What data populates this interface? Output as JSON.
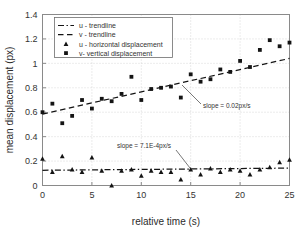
{
  "chart_data": {
    "type": "scatter",
    "title": "",
    "xlabel": "relative time (s)",
    "ylabel": "mean displacement (px)",
    "xlim": [
      0,
      25
    ],
    "ylim": [
      0,
      1.4
    ],
    "xticks": [
      "0",
      "5",
      "10",
      "15",
      "20",
      "25"
    ],
    "xtick_values": [
      0,
      5,
      10,
      15,
      20,
      25
    ],
    "yticks": [
      "0",
      "0.2",
      "0.4",
      "0.6",
      "0.8",
      "1",
      "1.2",
      "1.4"
    ],
    "ytick_values": [
      0,
      0.2,
      0.4,
      0.6,
      0.8,
      1,
      1.2,
      1.4
    ],
    "grid": true,
    "legend_position": "upper-left",
    "marker_color": "#141414",
    "line_color": "#141414",
    "grid_color": "#c8c8c8",
    "axis_color": "#8a8a8a",
    "x": [
      0,
      1,
      2,
      3,
      4,
      5,
      6,
      7,
      8,
      9,
      10,
      11,
      12,
      13,
      14,
      15,
      16,
      17,
      18,
      19,
      20,
      21,
      22,
      23,
      24,
      25
    ],
    "series": [
      {
        "name": "v- vertical displacement",
        "marker": "square",
        "values": [
          0.6,
          0.67,
          0.51,
          0.57,
          0.7,
          0.63,
          0.71,
          0.69,
          0.75,
          0.89,
          0.7,
          0.79,
          0.8,
          0.81,
          0.72,
          0.91,
          0.85,
          0.87,
          0.95,
          0.93,
          1.02,
          0.97,
          1.11,
          1.19,
          1.14,
          1.17
        ]
      },
      {
        "name": "u - horizontal displacement",
        "marker": "triangle",
        "values": [
          0.22,
          0.11,
          0.24,
          0.13,
          0.11,
          0.23,
          0.12,
          0.0,
          0.12,
          0.13,
          0.08,
          0.12,
          0.11,
          0.11,
          0.05,
          0.13,
          0.09,
          0.14,
          0.11,
          0.13,
          0.12,
          0.09,
          0.13,
          0.15,
          0.19,
          0.21
        ]
      }
    ],
    "trendlines": [
      {
        "name": "v - trendline",
        "style": "dashed",
        "intercept": 0.585,
        "slope": 0.0182,
        "x_start": 0,
        "x_end": 25
      },
      {
        "name": "u - trendline",
        "style": "dash-dot",
        "intercept": 0.1245,
        "slope": 0.00071,
        "x_start": 0,
        "x_end": 25
      }
    ],
    "legend": [
      {
        "label": "u - trendline",
        "type": "line",
        "style": "dash-dot"
      },
      {
        "label": "v - trendline",
        "type": "line",
        "style": "dashed"
      },
      {
        "label": "u - horizontal displacement",
        "type": "marker",
        "marker": "triangle"
      },
      {
        "label": "v- vertical displacement",
        "type": "marker",
        "marker": "square"
      }
    ],
    "annotations": [
      {
        "text": "slope = 0.02px/s",
        "text_x": 203,
        "text_y": 108,
        "leader_x1": 201,
        "leader_y1": 104,
        "leader_x2": 182,
        "leader_y2": 85
      },
      {
        "text": "slope = 7.1E-4px/s",
        "text_x": 117,
        "text_y": 148,
        "leader_x1": 176,
        "leader_y1": 150,
        "leader_x2": 190,
        "leader_y2": 168
      }
    ]
  }
}
